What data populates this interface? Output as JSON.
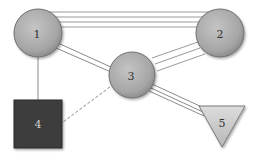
{
  "diagram": {
    "colors": {
      "edge": "#9a9a9a",
      "circle_fill": "#a9a9a9",
      "circle_stroke": "#6f6f6f",
      "square_fill": "#3d3d3d",
      "triangle_fill": "#c8c8c8",
      "label_dark": "#333333",
      "label_light": "#cfcfcf"
    },
    "nodes": [
      {
        "id": "1",
        "label": "1",
        "shape": "circle"
      },
      {
        "id": "2",
        "label": "2",
        "shape": "circle"
      },
      {
        "id": "3",
        "label": "3",
        "shape": "circle"
      },
      {
        "id": "4",
        "label": "4",
        "shape": "square"
      },
      {
        "id": "5",
        "label": "5",
        "shape": "triangle"
      }
    ],
    "edges": [
      {
        "from": "1",
        "to": "2",
        "multiplicity": 4,
        "style": "solid"
      },
      {
        "from": "1",
        "to": "3",
        "multiplicity": 2,
        "style": "solid"
      },
      {
        "from": "2",
        "to": "3",
        "multiplicity": 3,
        "style": "solid"
      },
      {
        "from": "1",
        "to": "4",
        "multiplicity": 1,
        "style": "solid"
      },
      {
        "from": "3",
        "to": "4",
        "multiplicity": 1,
        "style": "dashed"
      },
      {
        "from": "3",
        "to": "5",
        "multiplicity": 3,
        "style": "solid"
      }
    ]
  }
}
